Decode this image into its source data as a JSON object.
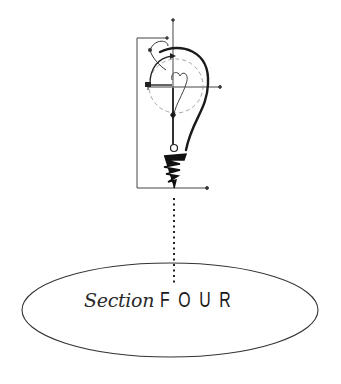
{
  "section": {
    "word": "Section",
    "number": "FOUR"
  },
  "illustration": {
    "icon": "lightbulb-diagram-icon",
    "connector": "dotted-line"
  },
  "colors": {
    "ink": "#1a1a1a",
    "line": "#333333",
    "dashed": "#999999",
    "background": "#ffffff"
  }
}
